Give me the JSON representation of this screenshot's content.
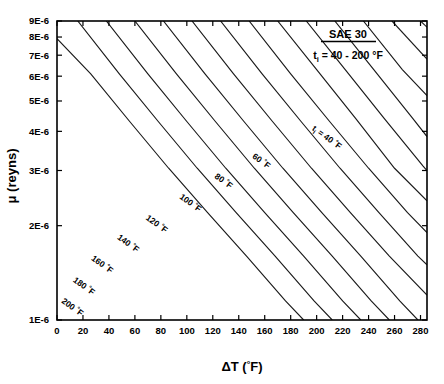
{
  "figure": {
    "legend": {
      "title": "SAE 30",
      "condition_prefix": "t",
      "condition_sub": "i",
      "condition_value": " = 40 - 200 ",
      "condition_unit": "°F"
    },
    "caption_faint": ""
  },
  "chart_data": {
    "type": "line",
    "title": "SAE 30",
    "subtitle": "t_i = 40 - 200 °F",
    "xlabel": "ΔT (°F)",
    "ylabel": "μ (reyns)",
    "xscale": "linear",
    "yscale": "log",
    "xlim": [
      0,
      285
    ],
    "ylim": [
      1e-06,
      9e-06
    ],
    "grid": false,
    "legend_position": "inside-curve-labels",
    "xticks": [
      0,
      20,
      40,
      60,
      80,
      100,
      120,
      140,
      160,
      180,
      200,
      220,
      240,
      260,
      280
    ],
    "xticklabels": [
      "0",
      "20",
      "40",
      "60",
      "80",
      "100",
      "120",
      "140",
      "160",
      "180",
      "200",
      "220",
      "240",
      "260",
      "280"
    ],
    "yticks": [
      1e-06,
      2e-06,
      3e-06,
      4e-06,
      5e-06,
      6e-06,
      7e-06,
      8e-06,
      9e-06
    ],
    "yticklabels": [
      "1E-6",
      "2E-6",
      "3E-6",
      "4E-6",
      "5E-6",
      "6E-6",
      "7E-6",
      "8E-6",
      "9E-6"
    ],
    "series": [
      {
        "name": "40 °F",
        "label": "t = 40 °F",
        "label_is_first": true,
        "label_x": 196,
        "label_y": 4.05e-06,
        "x": [
          170,
          200,
          230,
          260,
          285
        ],
        "y": [
          9e-06,
          6.3e-06,
          4.4e-06,
          3.05e-06,
          2.4e-06
        ]
      },
      {
        "name": "60 °F",
        "label": "60 °F",
        "label_x": 150,
        "label_y": 3.3e-06,
        "x": [
          148,
          180,
          210,
          240,
          270,
          285
        ],
        "y": [
          9e-06,
          6.1e-06,
          4.3e-06,
          3.05e-06,
          2.2e-06,
          1.9e-06
        ]
      },
      {
        "name": "80 °F",
        "label": "80 °F",
        "label_x": 121,
        "label_y": 2.85e-06,
        "x": [
          126,
          158,
          188,
          218,
          248,
          278,
          285
        ],
        "y": [
          9e-06,
          6.1e-06,
          4.3e-06,
          3.05e-06,
          2.2e-06,
          1.6e-06,
          1.5e-06
        ]
      },
      {
        "name": "100 °F",
        "label": "100 °F",
        "label_x": 94,
        "label_y": 2.45e-06,
        "x": [
          104,
          136,
          166,
          196,
          226,
          256,
          285
        ],
        "y": [
          9e-06,
          6.1e-06,
          4.3e-06,
          3.05e-06,
          2.2e-06,
          1.6e-06,
          1.2e-06
        ]
      },
      {
        "name": "120 °F",
        "label": "120 °F",
        "label_x": 68,
        "label_y": 2.1e-06,
        "x": [
          82,
          114,
          144,
          174,
          204,
          234,
          264,
          278
        ],
        "y": [
          9e-06,
          6.1e-06,
          4.3e-06,
          3.05e-06,
          2.2e-06,
          1.6e-06,
          1.15e-06,
          1e-06
        ]
      },
      {
        "name": "140 °F",
        "label": "140 °F",
        "label_x": 46,
        "label_y": 1.82e-06,
        "x": [
          60,
          92,
          122,
          152,
          182,
          212,
          242,
          256
        ],
        "y": [
          9e-06,
          6.1e-06,
          4.3e-06,
          3.05e-06,
          2.2e-06,
          1.6e-06,
          1.15e-06,
          1e-06
        ]
      },
      {
        "name": "160 °F",
        "label": "160 °F",
        "label_x": 26,
        "label_y": 1.56e-06,
        "x": [
          38,
          70,
          100,
          130,
          160,
          190,
          220,
          234
        ],
        "y": [
          9e-06,
          6.1e-06,
          4.3e-06,
          3.05e-06,
          2.2e-06,
          1.6e-06,
          1.15e-06,
          1e-06
        ]
      },
      {
        "name": "180 °F",
        "label": "180 °F",
        "label_x": 12,
        "label_y": 1.33e-06,
        "x": [
          16,
          48,
          78,
          108,
          138,
          168,
          198,
          212
        ],
        "y": [
          9e-06,
          6.1e-06,
          4.3e-06,
          3.05e-06,
          2.2e-06,
          1.6e-06,
          1.15e-06,
          1e-06
        ]
      },
      {
        "name": "200 °F",
        "label": "200 °F",
        "label_x": 3,
        "label_y": 1.14e-06,
        "x": [
          0,
          26,
          56,
          86,
          116,
          146,
          176,
          190
        ],
        "y": [
          7.9e-06,
          6.1e-06,
          4.3e-06,
          3.05e-06,
          2.2e-06,
          1.6e-06,
          1.15e-06,
          1e-06
        ]
      },
      {
        "name": "unlabeled-1",
        "label": "",
        "x": [
          192,
          222,
          252,
          282,
          285
        ],
        "y": [
          9e-06,
          6.3e-06,
          4.4e-06,
          3.1e-06,
          3e-06
        ]
      },
      {
        "name": "unlabeled-2",
        "label": "",
        "x": [
          214,
          244,
          274,
          285
        ],
        "y": [
          9e-06,
          6.3e-06,
          4.4e-06,
          3.85e-06
        ]
      },
      {
        "name": "unlabeled-3",
        "label": "",
        "x": [
          236,
          266,
          285
        ],
        "y": [
          9e-06,
          6.3e-06,
          5.2e-06
        ]
      },
      {
        "name": "unlabeled-4",
        "label": "",
        "x": [
          258,
          285
        ],
        "y": [
          9e-06,
          6.8e-06
        ]
      },
      {
        "name": "unlabeled-5",
        "label": "",
        "x": [
          280,
          285
        ],
        "y": [
          9e-06,
          8.6e-06
        ]
      }
    ]
  }
}
